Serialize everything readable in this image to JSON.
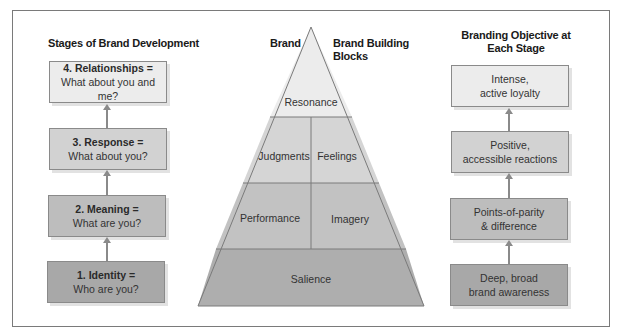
{
  "left_column": {
    "heading": "Stages of Brand Development",
    "stages": [
      {
        "title": "4. Relationships =",
        "question": "What about you and me?",
        "fill": "#ececec"
      },
      {
        "title": "3. Response =",
        "question": "What about you?",
        "fill": "#d2d2d2"
      },
      {
        "title": "2. Meaning =",
        "question": "What are you?",
        "fill": "#bdbdbd"
      },
      {
        "title": "1. Identity =",
        "question": "Who are you?",
        "fill": "#a8a8a8"
      }
    ]
  },
  "pyramid": {
    "heading_left": "Brand",
    "heading_right": "Brand Building Blocks",
    "heading_right_line1": "Brand Building",
    "heading_right_line2": "Blocks",
    "blocks": {
      "resonance": "Resonance",
      "judgments": "Judgments",
      "feelings": "Feelings",
      "performance": "Performance",
      "imagery": "Imagery",
      "salience": "Salience"
    },
    "colors": {
      "tier1": "#ececec",
      "tier2": "#d5d5d5",
      "tier3": "#c2c2c2",
      "tier4": "#aeaeae",
      "line": "#7a7a7a"
    }
  },
  "right_column": {
    "heading_line1": "Branding Objective at",
    "heading_line2": "Each Stage",
    "objectives": [
      {
        "line1": "Intense,",
        "line2": "active loyalty",
        "fill": "#ececec"
      },
      {
        "line1": "Positive,",
        "line2": "accessible reactions",
        "fill": "#d2d2d2"
      },
      {
        "line1": "Points-of-parity",
        "line2": "& difference",
        "fill": "#bdbdbd"
      },
      {
        "line1": "Deep, broad",
        "line2": "brand awareness",
        "fill": "#a8a8a8"
      }
    ]
  }
}
